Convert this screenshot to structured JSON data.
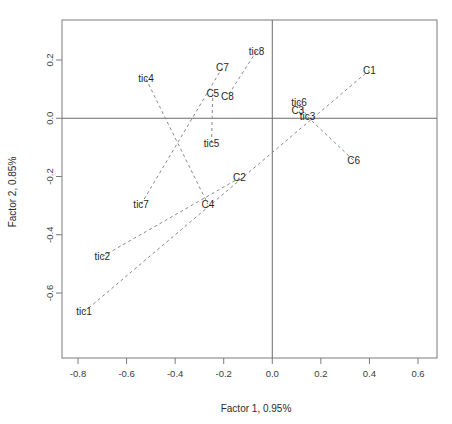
{
  "figure": {
    "background": "#ffffff",
    "line_color": "#888888",
    "axis_color": "#6b6b6b",
    "text_color": "#1f1f1f"
  },
  "top_cropped_text": "",
  "chart_data": {
    "type": "scatter",
    "title": "",
    "xlabel": "Factor 1, 0.95%",
    "ylabel": "Factor 2, 0.85%",
    "xlim": [
      -0.88,
      0.66
    ],
    "ylim": [
      -0.72,
      0.28
    ],
    "xticks": [
      -0.8,
      -0.6,
      -0.4,
      -0.2,
      0.0,
      0.2,
      0.4,
      0.6
    ],
    "xticklabels": [
      "-0.8",
      "-0.6",
      "-0.4",
      "-0.2",
      "0.0",
      "0.2",
      "0.4",
      "0.6"
    ],
    "yticks": [
      -0.6,
      -0.4,
      -0.2,
      0.0,
      0.2
    ],
    "yticklabels": [
      "-0.6",
      "-0.4",
      "-0.2",
      "0.0",
      "0.2"
    ],
    "grid": false,
    "legend": "none",
    "reference_lines": [
      {
        "name": "horizontal-zero-line",
        "orientation": "horizontal",
        "value": 0.0
      },
      {
        "name": "vertical-zero-line",
        "orientation": "vertical",
        "value": 0.0
      }
    ],
    "points": [
      {
        "label": "C1",
        "x": 0.4,
        "y": 0.165
      },
      {
        "label": "C2",
        "x": -0.135,
        "y": -0.205
      },
      {
        "label": "C3",
        "x": 0.105,
        "y": 0.025
      },
      {
        "label": "C4",
        "x": -0.265,
        "y": -0.295
      },
      {
        "label": "C5",
        "x": -0.245,
        "y": 0.085
      },
      {
        "label": "C6",
        "x": 0.335,
        "y": -0.145
      },
      {
        "label": "C7",
        "x": -0.205,
        "y": 0.175
      },
      {
        "label": "C8",
        "x": -0.185,
        "y": 0.075
      },
      {
        "label": "tic1",
        "x": -0.775,
        "y": -0.665
      },
      {
        "label": "tic2",
        "x": -0.7,
        "y": -0.475
      },
      {
        "label": "tic3",
        "x": 0.145,
        "y": 0.005
      },
      {
        "label": "tic4",
        "x": -0.52,
        "y": 0.135
      },
      {
        "label": "tic5",
        "x": -0.25,
        "y": -0.085
      },
      {
        "label": "tic6",
        "x": 0.11,
        "y": 0.055
      },
      {
        "label": "tic7",
        "x": -0.54,
        "y": -0.295
      },
      {
        "label": "tic8",
        "x": -0.065,
        "y": 0.23
      }
    ],
    "connections": [
      {
        "from": "tic1",
        "to": "C1"
      },
      {
        "from": "tic2",
        "to": "C2"
      },
      {
        "from": "tic3",
        "to": "C6"
      },
      {
        "from": "tic4",
        "to": "C4"
      },
      {
        "from": "tic5",
        "to": "C5"
      },
      {
        "from": "tic6",
        "to": "tic3"
      },
      {
        "from": "tic7",
        "to": "C7"
      },
      {
        "from": "tic8",
        "to": "C8"
      }
    ]
  }
}
